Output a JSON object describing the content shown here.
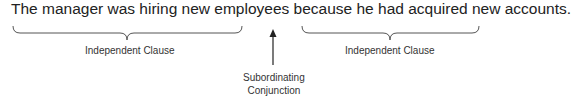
{
  "sentence": "The manager was hiring new employees because he had acquired new accounts.",
  "labels": {
    "left_clause": "Independent Clause",
    "right_clause": "Independent Clause",
    "conjunction_line1": "Subordinating",
    "conjunction_line2": "Conjunction"
  },
  "colors": {
    "stroke": "#444444",
    "text": "#222222"
  }
}
